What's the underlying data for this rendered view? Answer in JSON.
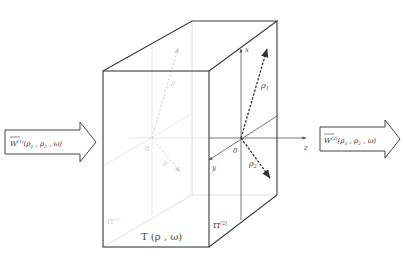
{
  "diagram": {
    "type": "3d-slab-transmission",
    "colors": {
      "edge": "#3a3a3a",
      "hidden_edge": "#d0d0d0",
      "axis": "#555555",
      "hidden_axis": "#d4d4d4",
      "vector": "#333333",
      "hidden_vector": "#c8c8c8",
      "arrow_border": "#444444"
    },
    "input_arrow": {
      "vector": "W",
      "superscript": "(1)",
      "args": "(ρ",
      "arg1_sub": "1",
      "sep": " ,  ρ",
      "arg2_sub": "2",
      "tail": " , ω)"
    },
    "output_arrow": {
      "vector": "W",
      "superscript": "(2)",
      "args": "(ρ",
      "arg1_sub": "1",
      "sep": " ,  ρ",
      "arg2_sub": "2",
      "tail": " , ω)"
    },
    "box": {
      "transfer_label": "T (ρ ,  ω)",
      "front_plane_label": "Π",
      "front_plane_sup": "(2)",
      "back_plane_label": "Π",
      "back_plane_sup": "(1)"
    },
    "axes": {
      "x": "x",
      "y": "y",
      "z": "z",
      "origin": "0"
    },
    "vectors": {
      "rho_up": "ρ",
      "rho_up_sub": "1",
      "rho_down": "ρ",
      "rho_down_sub": "2"
    },
    "hidden_labels": {
      "origin": "0",
      "rho_up": "ρ",
      "rho_down": "ρ"
    }
  }
}
